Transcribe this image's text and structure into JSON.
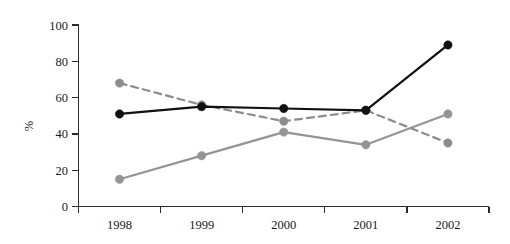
{
  "chart_data": {
    "type": "line",
    "title": "",
    "subtitle": "",
    "xlabel": "",
    "ylabel": "%",
    "categories": [
      "1998",
      "1999",
      "2000",
      "2001",
      "2002"
    ],
    "x": [
      1998,
      1999,
      2000,
      2001,
      2002
    ],
    "ylim": [
      0,
      100
    ],
    "yticks": [
      0,
      20,
      40,
      60,
      80,
      100
    ],
    "ytick_labels": [
      "0",
      "20",
      "40",
      "60",
      "80",
      "100"
    ],
    "grid": false,
    "legend": "none",
    "legend_position": "none",
    "series": [
      {
        "name": "black-solid",
        "values": [
          51,
          55,
          54,
          53,
          89
        ],
        "color": "#111111",
        "line_style": "solid",
        "line_width": 2.2,
        "marker": "circle",
        "marker_size": 4.2
      },
      {
        "name": "gray-dashed",
        "values": [
          68,
          56,
          47,
          53,
          35
        ],
        "color": "#8c8c8c",
        "line_style": "dashed",
        "line_width": 2.2,
        "marker": "circle",
        "marker_size": 4.2
      },
      {
        "name": "gray-solid",
        "values": [
          15,
          28,
          41,
          34,
          51
        ],
        "color": "#949494",
        "line_style": "solid",
        "line_width": 2.2,
        "marker": "circle",
        "marker_size": 4.2
      }
    ],
    "annotations": []
  },
  "axes": {
    "y_axis_label": "%",
    "x_tick_labels": [
      "1998",
      "1999",
      "2000",
      "2001",
      "2002"
    ],
    "y_tick_labels": [
      "100",
      "80",
      "60",
      "40",
      "20",
      "0"
    ]
  },
  "colors": {
    "background": "#ffffff",
    "axis": "#2b2b2b",
    "text": "#1a1a1a",
    "series_black": "#111111",
    "series_gray_dashed": "#8c8c8c",
    "series_gray_solid": "#949494"
  }
}
